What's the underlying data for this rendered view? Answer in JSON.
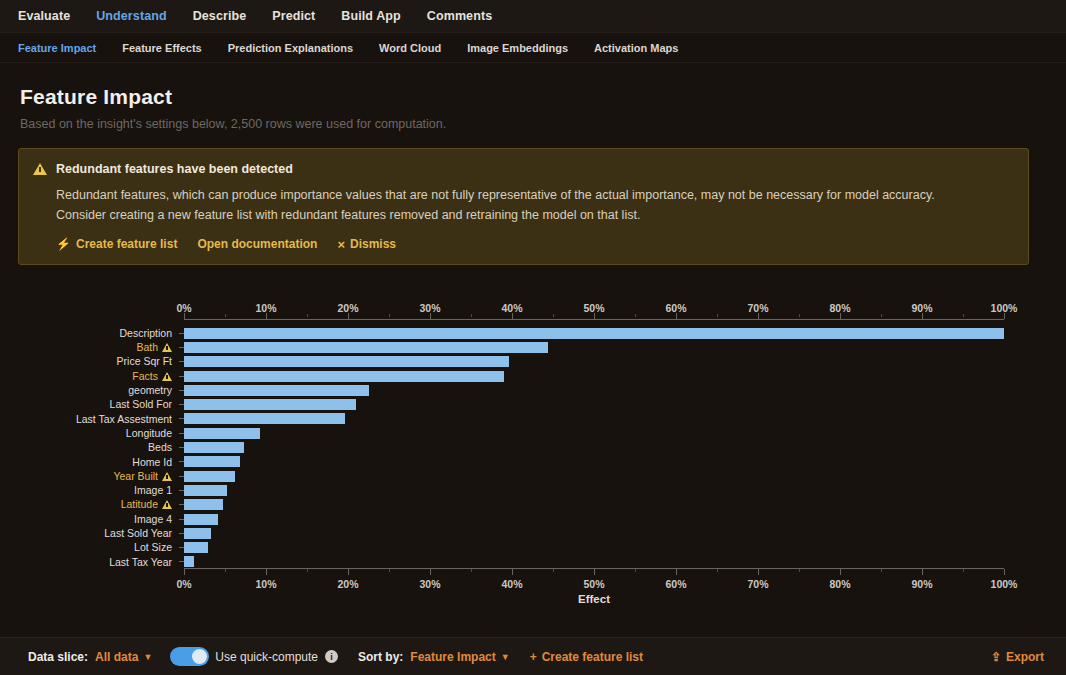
{
  "topnav": {
    "items": [
      {
        "label": "Evaluate",
        "active": false
      },
      {
        "label": "Understand",
        "active": true
      },
      {
        "label": "Describe",
        "active": false
      },
      {
        "label": "Predict",
        "active": false
      },
      {
        "label": "Build App",
        "active": false
      },
      {
        "label": "Comments",
        "active": false
      }
    ]
  },
  "subnav": {
    "items": [
      {
        "label": "Feature Impact",
        "active": true
      },
      {
        "label": "Feature Effects",
        "active": false
      },
      {
        "label": "Prediction Explanations",
        "active": false
      },
      {
        "label": "Word Cloud",
        "active": false
      },
      {
        "label": "Image Embeddings",
        "active": false
      },
      {
        "label": "Activation Maps",
        "active": false
      }
    ]
  },
  "header": {
    "title": "Feature Impact",
    "subtitle": "Based on the insight's settings below, 2,500 rows were used for computation."
  },
  "banner": {
    "icon": "warning-triangle-icon",
    "title": "Redundant features have been detected",
    "line1": "Redundant features, which can produce importance values that are not fully representative of the actual importance, may not be necessary for model accuracy.",
    "line2": "Consider creating a new feature list with redundant features removed and retraining the model on that list.",
    "actions": [
      {
        "label": "Create feature list",
        "icon": "bolt-icon"
      },
      {
        "label": "Open documentation",
        "icon": ""
      },
      {
        "label": "Dismiss",
        "icon": "close-icon"
      }
    ]
  },
  "chart_data": {
    "type": "bar",
    "orientation": "horizontal",
    "title": "Feature Impact",
    "xlabel": "Effect",
    "ylabel": "",
    "xlim": [
      0,
      100
    ],
    "grid": false,
    "legend": null,
    "bar_color": "#8ec0ec",
    "tick_labels": [
      "0%",
      "10%",
      "20%",
      "30%",
      "40%",
      "50%",
      "60%",
      "70%",
      "80%",
      "90%",
      "100%"
    ],
    "tick_values": [
      0,
      10,
      20,
      30,
      40,
      50,
      60,
      70,
      80,
      90,
      100
    ],
    "categories": [
      "Description",
      "Bath",
      "Price Sqr Ft",
      "Facts",
      "geometry",
      "Last Sold For",
      "Last Tax Assestment",
      "Longitude",
      "Beds",
      "Home Id",
      "Year Built",
      "Image 1",
      "Latitude",
      "Image 4",
      "Last Sold Year",
      "Lot Size",
      "Last Tax Year"
    ],
    "values": [
      100.0,
      44.4,
      39.6,
      39.0,
      22.5,
      21.0,
      19.6,
      9.3,
      7.3,
      6.8,
      6.2,
      5.2,
      4.7,
      4.1,
      3.3,
      2.9,
      1.2
    ],
    "redundant_flags": [
      false,
      true,
      false,
      true,
      false,
      false,
      false,
      false,
      false,
      false,
      true,
      false,
      true,
      false,
      false,
      false,
      false
    ]
  },
  "footer": {
    "data_slice_label": "Data slice:",
    "data_slice_value": "All data",
    "quick_compute_label": "Use quick-compute",
    "info_icon": "info-icon",
    "sort_by_label": "Sort by:",
    "sort_by_value": "Feature Impact",
    "create_feature_list": "Create feature list",
    "export_label": "Export",
    "export_icon": "upload-icon"
  }
}
